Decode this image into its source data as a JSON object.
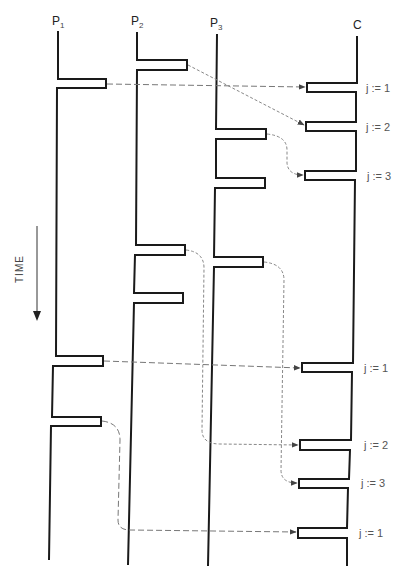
{
  "diagram": {
    "processes": [
      {
        "id": "P1",
        "label": "P",
        "sub": "1",
        "x": 57
      },
      {
        "id": "P2",
        "label": "P",
        "sub": "2",
        "x": 137
      },
      {
        "id": "P3",
        "label": "P",
        "sub": "3",
        "x": 216
      },
      {
        "id": "C",
        "label": "C",
        "sub": "",
        "x": 357
      }
    ],
    "time_axis": {
      "label": "TIME",
      "direction": "down"
    },
    "receive_labels": [
      {
        "text": "j := 1",
        "y": 88
      },
      {
        "text": "j := 2",
        "y": 127
      },
      {
        "text": "j := 3",
        "y": 176
      },
      {
        "text": "j := 1",
        "y": 368
      },
      {
        "text": "j := 2",
        "y": 445
      },
      {
        "text": "j := 3",
        "y": 483
      },
      {
        "text": "j := 1",
        "y": 533
      }
    ],
    "messages": [
      {
        "from": "P1",
        "to": "C",
        "j": 1
      },
      {
        "from": "P2",
        "to": "C",
        "j": 2
      },
      {
        "from": "P3",
        "to": "C",
        "j": 3
      },
      {
        "from": "P1",
        "to": "C",
        "j": 1
      },
      {
        "from": "P2",
        "to": "C",
        "j": 2
      },
      {
        "from": "P3",
        "to": "C",
        "j": 3
      },
      {
        "from": "P1",
        "to": "C",
        "j": 1
      }
    ],
    "colors": {
      "line": "#1a1a1a",
      "message": "#777777",
      "text": "#555555"
    }
  }
}
